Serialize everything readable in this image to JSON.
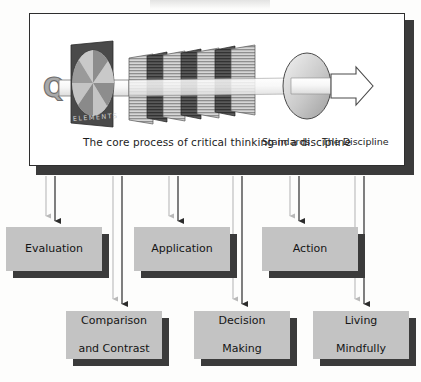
{
  "diagram": {
    "caption": "The core process of critical thinking in a discipline",
    "source_letter": "Q",
    "elements_label": "ELEMENTS",
    "standards_label": "Standards",
    "discipline_label": "The Discipline",
    "standards_plane_count": 7,
    "colors": {
      "box_fill": "#c3c3c3",
      "shadow": "#3b3b3b",
      "panel_bg": "#ffffff",
      "panel_border": "#2e2e2e",
      "arrow_dark": "#2b2b2b",
      "arrow_light": "#b9b9b9",
      "text": "#151515"
    },
    "outcome_boxes": {
      "row_top": [
        {
          "id": "evaluation",
          "label": "Evaluation"
        },
        {
          "id": "application",
          "label": "Application"
        },
        {
          "id": "action",
          "label": "Action"
        }
      ],
      "row_bottom": [
        {
          "id": "comparison-and-contrast",
          "line1": "Comparison",
          "line2": "and Contrast"
        },
        {
          "id": "decision-making",
          "line1": "Decision",
          "line2": "Making"
        },
        {
          "id": "living-mindfully",
          "line1": "Living",
          "line2": "Mindfully"
        }
      ]
    }
  }
}
